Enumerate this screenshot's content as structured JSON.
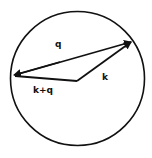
{
  "diagram": {
    "type": "vector-diagram",
    "labels": {
      "q": "q",
      "k": "k",
      "k_plus_q": "k+q"
    },
    "colors": {
      "stroke": "#111111",
      "background": "#ffffff"
    }
  }
}
